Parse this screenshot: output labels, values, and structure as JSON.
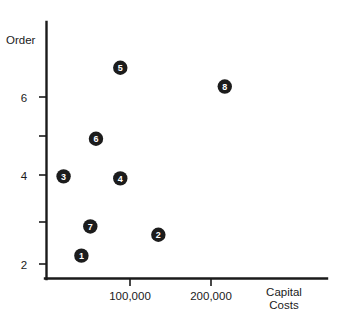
{
  "chart_data": {
    "type": "scatter",
    "title": "",
    "subtitle": "",
    "xlabel": "Capital Costs",
    "ylabel": "Order",
    "xlim": [
      0,
      265000
    ],
    "ylim": [
      1.55,
      7.3
    ],
    "grid": false,
    "legend": "none",
    "x_ticks": [
      {
        "value": 100000,
        "label": "100,000"
      },
      {
        "value": 200000,
        "label": "200,000"
      }
    ],
    "y_ticks": [
      {
        "value": 2,
        "label": "2"
      },
      {
        "value": 3,
        "label": ""
      },
      {
        "value": 4,
        "label": "4"
      },
      {
        "value": 5,
        "label": ""
      },
      {
        "value": 6,
        "label": "6"
      }
    ],
    "point_label_style": "filled-circle-with-white-number",
    "points": [
      {
        "label": "1",
        "x": 40000,
        "y": 2.2
      },
      {
        "label": "2",
        "x": 135000,
        "y": 2.7
      },
      {
        "label": "3",
        "x": 18000,
        "y": 4.1
      },
      {
        "label": "4",
        "x": 88000,
        "y": 4.05
      },
      {
        "label": "5",
        "x": 88000,
        "y": 6.7
      },
      {
        "label": "6",
        "x": 58000,
        "y": 5.0
      },
      {
        "label": "7",
        "x": 51000,
        "y": 2.9
      },
      {
        "label": "8",
        "x": 217000,
        "y": 6.25
      }
    ]
  },
  "axes": {
    "y_axis_label": "Order",
    "x_axis_label_line1": "Capital",
    "x_axis_label_line2": "Costs"
  },
  "colors": {
    "marker": "#1c1c1c",
    "marker_text": "#ffffff",
    "axis": "#1a1a1a",
    "background": "#ffffff"
  }
}
